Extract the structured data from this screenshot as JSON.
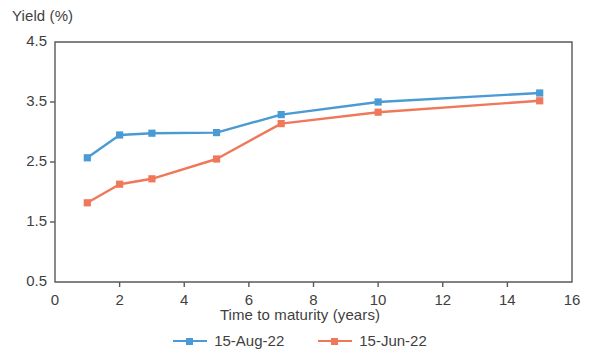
{
  "chart_data": {
    "type": "line",
    "title": "",
    "xlabel": "Time to maturity (years)",
    "ylabel": "Yield (%)",
    "xlim": [
      0,
      16
    ],
    "ylim": [
      0.5,
      4.5
    ],
    "xticks": [
      "0",
      "2",
      "4",
      "6",
      "8",
      "10",
      "12",
      "14",
      "16"
    ],
    "xtick_values": [
      0,
      2,
      4,
      6,
      8,
      10,
      12,
      14,
      16
    ],
    "yticks": [
      "0.5",
      "1.5",
      "2.5",
      "3.5",
      "4.5"
    ],
    "ytick_values": [
      0.5,
      1.5,
      2.5,
      3.5,
      4.5
    ],
    "grid": false,
    "legend_position": "bottom-center",
    "x": [
      1,
      2,
      3,
      5,
      7,
      10,
      15
    ],
    "series": [
      {
        "name": "15-Aug-22",
        "color": "#4a9bd4",
        "marker": "square",
        "values": [
          2.57,
          2.95,
          2.98,
          2.99,
          3.29,
          3.5,
          3.65
        ]
      },
      {
        "name": "15-Jun-22",
        "color": "#f0785a",
        "marker": "square",
        "values": [
          1.82,
          2.13,
          2.22,
          2.55,
          3.14,
          3.33,
          3.52
        ]
      }
    ]
  },
  "colors": {
    "axis": "#595959",
    "text": "#3f3f3f",
    "background": "#ffffff"
  }
}
